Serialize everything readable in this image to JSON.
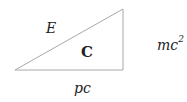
{
  "diagram": {
    "type": "right-triangle",
    "labels": {
      "hypotenuse": "E",
      "vertical_side_base": "mc",
      "vertical_side_exp": "2",
      "horizontal_side": "pc",
      "center": "C"
    },
    "colors": {
      "line": "#a8a8a8",
      "text": "#222222"
    }
  }
}
